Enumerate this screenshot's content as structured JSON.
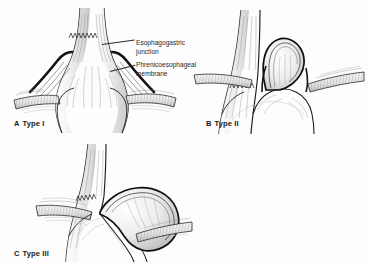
{
  "figure": {
    "background_color": "#fdfdfd",
    "ink_color": "#1a1a1a",
    "width": 370,
    "height": 263
  },
  "annotations": [
    {
      "id": "esophagogastric-junction",
      "line1": "Esophagogastric",
      "line2": "junction"
    },
    {
      "id": "phrenicoesophageal-membrane",
      "line1": "Phrenicoesophageal",
      "line2": "membrane"
    }
  ],
  "panels": [
    {
      "id": "panel-a",
      "letter": "A",
      "label": "Type I",
      "description": "Sliding hiatal hernia: esophagogastric junction displaced above the diaphragm with stretched phrenicoesophageal membrane"
    },
    {
      "id": "panel-b",
      "letter": "B",
      "label": "Type II",
      "description": "Paraesophageal hernia: gastric fundus herniates alongside a normally positioned esophagogastric junction"
    },
    {
      "id": "panel-c",
      "letter": "C",
      "label": "Type III",
      "description": "Mixed hernia: combined sliding and paraesophageal components"
    }
  ]
}
